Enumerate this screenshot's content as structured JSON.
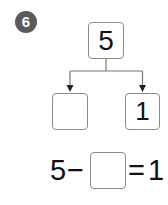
{
  "problem": {
    "number": "6",
    "top_value": "5",
    "left_value": "",
    "right_value": "1",
    "equation": {
      "minuend": "5",
      "operator": "−",
      "answer": "",
      "equals": "=",
      "result": "1"
    }
  },
  "colors": {
    "badge": "#5a5a5a",
    "box_border": "#8a8a8a",
    "line": "#777777"
  }
}
